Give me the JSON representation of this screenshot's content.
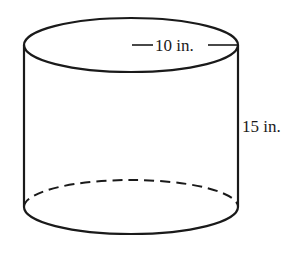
{
  "diagram": {
    "shape": "cylinder",
    "radius_label": "10 in.",
    "height_label": "15 in.",
    "stroke_color": "#1a1a1a",
    "background": "#ffffff"
  }
}
